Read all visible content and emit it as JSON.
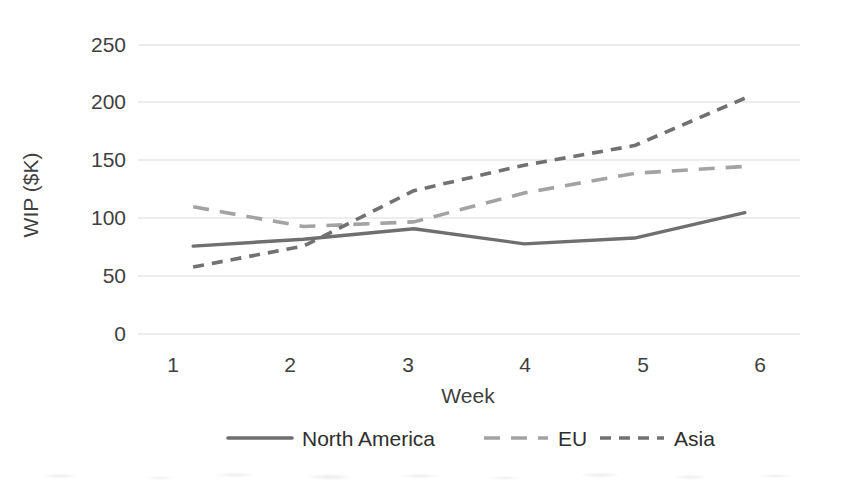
{
  "chart_data": {
    "type": "line",
    "title": "",
    "xlabel": "Week",
    "ylabel": "WIP ($K)",
    "categories": [
      "1",
      "2",
      "3",
      "4",
      "5",
      "6"
    ],
    "x": [
      1,
      2,
      3,
      4,
      5,
      6
    ],
    "xlim": [
      0.5,
      6.5
    ],
    "ylim": [
      0,
      250
    ],
    "yticks": [
      0,
      50,
      100,
      150,
      200,
      250
    ],
    "grid": "horizontal",
    "legend_position": "bottom",
    "series": [
      {
        "name": "North America",
        "values": [
          76,
          82,
          91,
          78,
          83,
          105
        ],
        "color": "#6f6f6f",
        "style": "solid"
      },
      {
        "name": "EU",
        "values": [
          110,
          93,
          97,
          122,
          139,
          145
        ],
        "color": "#a3a3a3",
        "style": "long-dash"
      },
      {
        "name": "Asia",
        "values": [
          58,
          76,
          124,
          146,
          163,
          204
        ],
        "color": "#717171",
        "style": "short-dash"
      }
    ]
  },
  "legend": {
    "items": [
      {
        "label": "North America",
        "marker": "solid-line-swatch"
      },
      {
        "label": "EU",
        "marker": "long-dash-line-swatch"
      },
      {
        "label": "Asia",
        "marker": "short-dash-line-swatch"
      }
    ]
  },
  "axes": {
    "y_label": "WIP ($K)",
    "x_label": "Week",
    "y_tick_labels": [
      "0",
      "50",
      "100",
      "150",
      "200",
      "250"
    ],
    "x_tick_labels": [
      "1",
      "2",
      "3",
      "4",
      "5",
      "6"
    ]
  },
  "colors": {
    "grid": "#dcdcdc",
    "text": "#3f3f3f",
    "north_america": "#6f6f6f",
    "eu": "#a3a3a3",
    "asia": "#717171"
  }
}
